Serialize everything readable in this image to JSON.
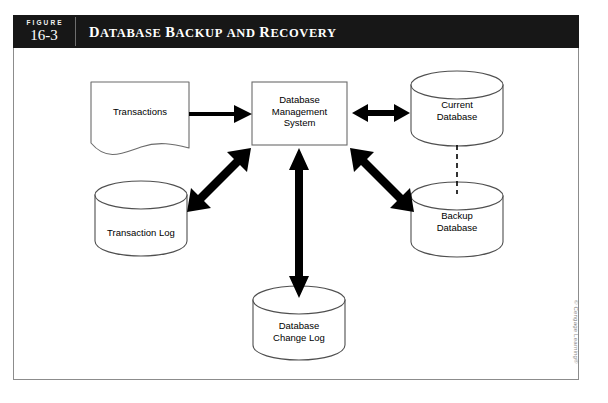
{
  "figure": {
    "label_word": "FIGURE",
    "number": "16-3",
    "title_text": "DATABASE BACKUP AND RECOVERY",
    "title_words": [
      "Database",
      "Backup",
      "and",
      "Recovery"
    ],
    "header_background": "#171717",
    "header_text_color": "#ffffff",
    "frame_border_color": "#8c8c8c"
  },
  "diagram": {
    "type": "flow-diagram",
    "nodes": [
      {
        "id": "transactions",
        "shape": "document",
        "label": "Transactions",
        "lines": [
          "Transactions"
        ]
      },
      {
        "id": "dbms",
        "shape": "rectangle",
        "label": "Database Management System",
        "lines": [
          "Database",
          "Management",
          "System"
        ]
      },
      {
        "id": "current-database",
        "shape": "cylinder",
        "label": "Current Database",
        "lines": [
          "Current",
          "Database"
        ]
      },
      {
        "id": "backup-database",
        "shape": "cylinder",
        "label": "Backup Database",
        "lines": [
          "Backup",
          "Database"
        ]
      },
      {
        "id": "transaction-log",
        "shape": "cylinder",
        "label": "Transaction Log",
        "lines": [
          "Transaction Log"
        ]
      },
      {
        "id": "database-change-log",
        "shape": "cylinder",
        "label": "Database Change Log",
        "lines": [
          "Database",
          "Change Log"
        ]
      }
    ],
    "connectors": [
      {
        "id": "transactions-to-dbms",
        "from": "transactions",
        "to": "dbms",
        "style": "solid",
        "heads": "single"
      },
      {
        "id": "dbms-to-current-database",
        "from": "dbms",
        "to": "current-database",
        "style": "solid",
        "heads": "double"
      },
      {
        "id": "dbms-to-backup-database",
        "from": "dbms",
        "to": "backup-database",
        "style": "solid",
        "heads": "double"
      },
      {
        "id": "dbms-to-transaction-log",
        "from": "dbms",
        "to": "transaction-log",
        "style": "solid",
        "heads": "double"
      },
      {
        "id": "dbms-to-database-change-log",
        "from": "dbms",
        "to": "database-change-log",
        "style": "solid",
        "heads": "double"
      },
      {
        "id": "current-to-backup-database",
        "from": "current-database",
        "to": "backup-database",
        "style": "dashed",
        "heads": "none"
      }
    ],
    "stroke_color": "#000000",
    "node_outline_color": "#555555",
    "node_fill": "#ffffff"
  },
  "credit": {
    "text": "© Cengage Learning®"
  }
}
